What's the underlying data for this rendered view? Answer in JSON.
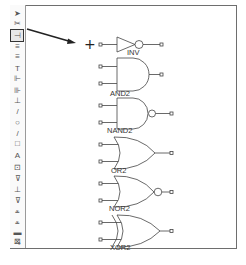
{
  "toolbar": {
    "tools": [
      {
        "name": "select-pointer",
        "glyph": "➤"
      },
      {
        "name": "cut",
        "glyph": "✂"
      },
      {
        "name": "place-component",
        "glyph": "⊣",
        "selected": true
      },
      {
        "name": "wire",
        "glyph": "≡"
      },
      {
        "name": "bus",
        "glyph": "≡"
      },
      {
        "name": "text-t",
        "glyph": "T"
      },
      {
        "name": "net-label",
        "glyph": "⊩"
      },
      {
        "name": "pin",
        "glyph": "⊪"
      },
      {
        "name": "power",
        "glyph": "⊥"
      },
      {
        "name": "line",
        "glyph": "/"
      },
      {
        "name": "circle",
        "glyph": "○"
      },
      {
        "name": "arc",
        "glyph": "/"
      },
      {
        "name": "rectangle",
        "glyph": "□"
      },
      {
        "name": "text",
        "glyph": "A"
      },
      {
        "name": "image",
        "glyph": "⊡"
      },
      {
        "name": "ground",
        "glyph": "⊽"
      },
      {
        "name": "vcc",
        "glyph": "⊥"
      },
      {
        "name": "port",
        "glyph": "⊽"
      },
      {
        "name": "hier-pin-1",
        "glyph": "⩡"
      },
      {
        "name": "hier-pin-2",
        "glyph": "⩡"
      },
      {
        "name": "junction",
        "glyph": "▬"
      },
      {
        "name": "no-connect",
        "glyph": "⊸"
      },
      {
        "name": "settings",
        "glyph": "⊠"
      }
    ]
  },
  "cursor": {
    "glyph": "+"
  },
  "gates": [
    {
      "type": "INV",
      "label": "INV"
    },
    {
      "type": "AND2",
      "label": "AND2"
    },
    {
      "type": "NAND2",
      "label": "NAND2"
    },
    {
      "type": "OR2",
      "label": "OR2"
    },
    {
      "type": "NOR2",
      "label": "NOR2"
    },
    {
      "type": "XOR2",
      "label": "XOR2"
    }
  ]
}
